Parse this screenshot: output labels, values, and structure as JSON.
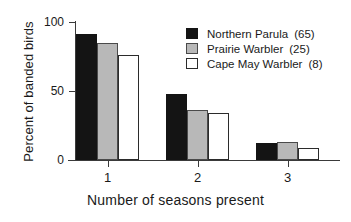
{
  "chart_data": {
    "type": "bar",
    "title": "",
    "xlabel": "Number of seasons present",
    "ylabel": "Percent of banded birds",
    "categories": [
      "1",
      "2",
      "3"
    ],
    "ylim": [
      0,
      100
    ],
    "yticks": [
      0,
      50,
      100
    ],
    "ytick_labels": [
      "0",
      "50",
      "100"
    ],
    "grid": false,
    "legend_position": "top-right",
    "series": [
      {
        "name": "Northern Parula",
        "count_label": "(65)",
        "color": "#141414",
        "values": [
          91,
          48,
          12
        ]
      },
      {
        "name": "Prairie Warbler",
        "count_label": "(25)",
        "color": "#b8b8b8",
        "values": [
          85,
          36,
          13
        ]
      },
      {
        "name": "Cape May Warbler",
        "count_label": "(8)",
        "color": "#ffffff",
        "values": [
          76,
          34,
          9
        ]
      }
    ]
  }
}
